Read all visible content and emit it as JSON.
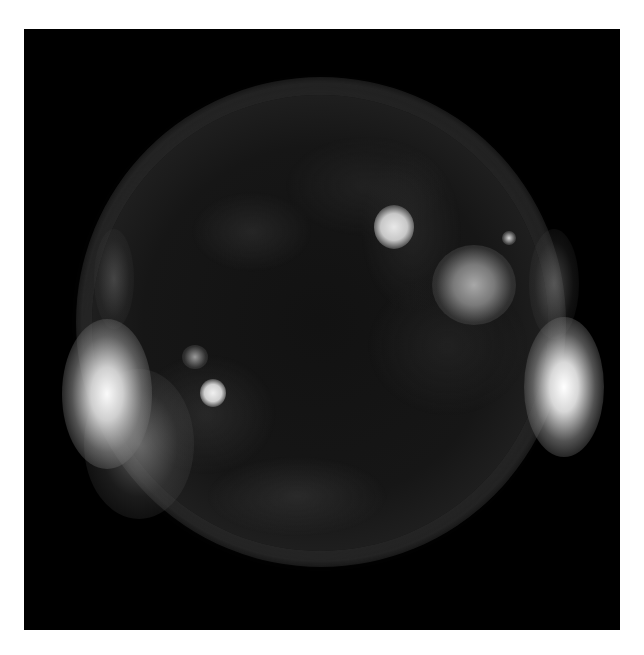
{
  "image": {
    "subject": "Sun",
    "description": "Grayscale extreme-ultraviolet / X-ray image of the solar disk showing bright active regions and limb brightenings",
    "colors": {
      "background": "#ffffff",
      "frame": "#000000",
      "disk": "#161616",
      "bright_region": "#f0f0f0"
    },
    "features": [
      {
        "name": "active-region-north-center",
        "brightness": "high"
      },
      {
        "name": "active-region-northeast",
        "brightness": "medium"
      },
      {
        "name": "active-region-southwest",
        "brightness": "high"
      },
      {
        "name": "limb-brightening-west",
        "brightness": "very high"
      },
      {
        "name": "limb-brightening-east",
        "brightness": "very high"
      }
    ]
  }
}
